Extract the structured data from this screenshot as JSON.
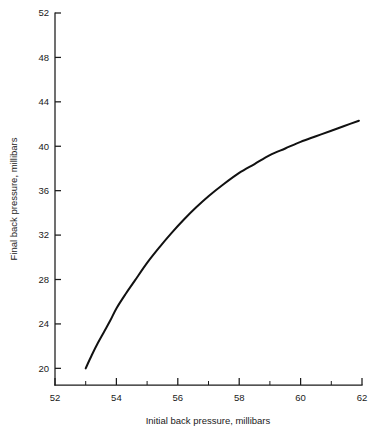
{
  "chart_data": {
    "type": "line",
    "title": "",
    "subtitle": "",
    "xlabel": "Initial back pressure, millibars",
    "ylabel": "Final back pressure, millibars",
    "xlim": [
      52,
      62
    ],
    "ylim": [
      18.5,
      52
    ],
    "xticks": [
      52,
      54,
      56,
      58,
      60,
      62
    ],
    "xticklabels": [
      "52",
      "54",
      "56",
      "58",
      "60",
      "62"
    ],
    "xminorticks": [
      53,
      55,
      57,
      59,
      61
    ],
    "yticks": [
      20,
      24,
      28,
      32,
      36,
      40,
      44,
      48,
      52
    ],
    "yticklabels": [
      "20",
      "24",
      "28",
      "32",
      "36",
      "40",
      "44",
      "48",
      "52"
    ],
    "grid": false,
    "legend": null,
    "annotations": [],
    "series": [
      {
        "name": "final vs initial back pressure",
        "color": "#111111",
        "x": [
          53.0,
          53.2,
          53.4,
          53.6,
          53.8,
          54.0,
          54.3,
          54.6,
          55.0,
          55.4,
          55.8,
          56.2,
          56.6,
          57.0,
          57.5,
          58.0,
          58.5,
          59.0,
          59.5,
          60.0,
          60.5,
          61.0,
          61.4,
          61.9
        ],
        "y": [
          20.0,
          21.2,
          22.3,
          23.3,
          24.3,
          25.4,
          26.7,
          27.9,
          29.5,
          30.9,
          32.2,
          33.4,
          34.5,
          35.5,
          36.6,
          37.6,
          38.4,
          39.2,
          39.8,
          40.4,
          40.9,
          41.4,
          41.8,
          42.3
        ]
      }
    ]
  }
}
